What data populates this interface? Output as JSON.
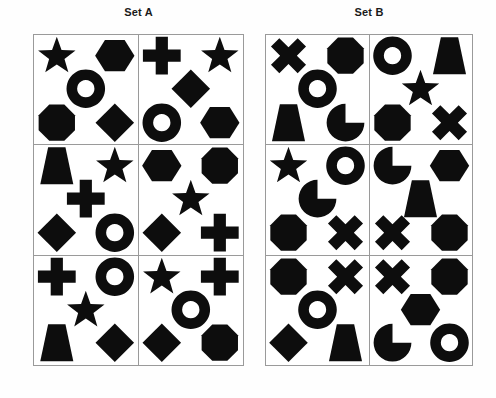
{
  "page": {
    "background_color": "#ffffff",
    "shape_color": "#0d0d0d",
    "grid_line_color": "#9a9a9a",
    "title_color": "#1a1a1a"
  },
  "sets": [
    {
      "id": "set-a",
      "title": "Set A",
      "columns": 2,
      "rows": 3,
      "cells": [
        {
          "row": 1,
          "col": 1,
          "shapes": [
            {
              "position": "top-left",
              "shape": "star"
            },
            {
              "position": "top-right",
              "shape": "hexagon"
            },
            {
              "position": "center",
              "shape": "ring"
            },
            {
              "position": "bottom-left",
              "shape": "octagon"
            },
            {
              "position": "bottom-right",
              "shape": "diamond"
            }
          ]
        },
        {
          "row": 1,
          "col": 2,
          "shapes": [
            {
              "position": "top-left",
              "shape": "cross"
            },
            {
              "position": "top-right",
              "shape": "star"
            },
            {
              "position": "center",
              "shape": "diamond"
            },
            {
              "position": "bottom-left",
              "shape": "ring"
            },
            {
              "position": "bottom-right",
              "shape": "hexagon"
            }
          ]
        },
        {
          "row": 2,
          "col": 1,
          "shapes": [
            {
              "position": "top-left",
              "shape": "trapezoid"
            },
            {
              "position": "top-right",
              "shape": "star"
            },
            {
              "position": "center",
              "shape": "cross"
            },
            {
              "position": "bottom-left",
              "shape": "diamond"
            },
            {
              "position": "bottom-right",
              "shape": "ring"
            }
          ]
        },
        {
          "row": 2,
          "col": 2,
          "shapes": [
            {
              "position": "top-left",
              "shape": "hexagon"
            },
            {
              "position": "top-right",
              "shape": "octagon"
            },
            {
              "position": "center",
              "shape": "star"
            },
            {
              "position": "bottom-left",
              "shape": "diamond"
            },
            {
              "position": "bottom-right",
              "shape": "cross"
            }
          ]
        },
        {
          "row": 3,
          "col": 1,
          "shapes": [
            {
              "position": "top-left",
              "shape": "cross"
            },
            {
              "position": "top-right",
              "shape": "ring"
            },
            {
              "position": "center",
              "shape": "star"
            },
            {
              "position": "bottom-left",
              "shape": "trapezoid"
            },
            {
              "position": "bottom-right",
              "shape": "diamond"
            }
          ]
        },
        {
          "row": 3,
          "col": 2,
          "shapes": [
            {
              "position": "top-left",
              "shape": "star"
            },
            {
              "position": "top-right",
              "shape": "cross"
            },
            {
              "position": "center",
              "shape": "ring"
            },
            {
              "position": "bottom-left",
              "shape": "diamond"
            },
            {
              "position": "bottom-right",
              "shape": "octagon"
            }
          ]
        }
      ]
    },
    {
      "id": "set-b",
      "title": "Set B",
      "columns": 2,
      "rows": 3,
      "cells": [
        {
          "row": 1,
          "col": 1,
          "shapes": [
            {
              "position": "top-left",
              "shape": "saltire"
            },
            {
              "position": "top-right",
              "shape": "octagon"
            },
            {
              "position": "center",
              "shape": "ring"
            },
            {
              "position": "bottom-left",
              "shape": "trapezoid"
            },
            {
              "position": "bottom-right",
              "shape": "pacman"
            }
          ]
        },
        {
          "row": 1,
          "col": 2,
          "shapes": [
            {
              "position": "top-left",
              "shape": "ring"
            },
            {
              "position": "top-right",
              "shape": "trapezoid"
            },
            {
              "position": "center",
              "shape": "star"
            },
            {
              "position": "bottom-left",
              "shape": "octagon"
            },
            {
              "position": "bottom-right",
              "shape": "saltire"
            }
          ]
        },
        {
          "row": 2,
          "col": 1,
          "shapes": [
            {
              "position": "top-left",
              "shape": "star"
            },
            {
              "position": "top-right",
              "shape": "ring"
            },
            {
              "position": "center",
              "shape": "pacman"
            },
            {
              "position": "bottom-left",
              "shape": "octagon"
            },
            {
              "position": "bottom-right",
              "shape": "saltire"
            }
          ]
        },
        {
          "row": 2,
          "col": 2,
          "shapes": [
            {
              "position": "top-left",
              "shape": "pacman"
            },
            {
              "position": "top-right",
              "shape": "hexagon"
            },
            {
              "position": "center",
              "shape": "trapezoid"
            },
            {
              "position": "bottom-left",
              "shape": "saltire"
            },
            {
              "position": "bottom-right",
              "shape": "octagon"
            }
          ]
        },
        {
          "row": 3,
          "col": 1,
          "shapes": [
            {
              "position": "top-left",
              "shape": "octagon"
            },
            {
              "position": "top-right",
              "shape": "saltire"
            },
            {
              "position": "center",
              "shape": "ring"
            },
            {
              "position": "bottom-left",
              "shape": "diamond"
            },
            {
              "position": "bottom-right",
              "shape": "trapezoid"
            }
          ]
        },
        {
          "row": 3,
          "col": 2,
          "shapes": [
            {
              "position": "top-left",
              "shape": "saltire"
            },
            {
              "position": "top-right",
              "shape": "octagon"
            },
            {
              "position": "center",
              "shape": "hexagon"
            },
            {
              "position": "bottom-left",
              "shape": "pacman"
            },
            {
              "position": "bottom-right",
              "shape": "ring"
            }
          ]
        }
      ]
    }
  ]
}
